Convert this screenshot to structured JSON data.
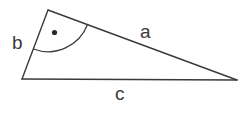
{
  "diagram": {
    "type": "right-triangle",
    "stroke_color": "#3a3a3a",
    "background": "#ffffff",
    "vertices": {
      "top": {
        "x": 48,
        "y": 10
      },
      "bottom_left": {
        "x": 22,
        "y": 79
      },
      "right": {
        "x": 237,
        "y": 80
      }
    },
    "sides": [
      {
        "id": "a",
        "label": "a",
        "from": "top",
        "to": "right"
      },
      {
        "id": "b",
        "label": "b",
        "from": "top",
        "to": "bottom_left"
      },
      {
        "id": "c",
        "label": "c",
        "from": "bottom_left",
        "to": "right"
      }
    ],
    "right_angle_marker": {
      "vertex": "top",
      "style": "arc-with-dot"
    },
    "labels": {
      "a": "a",
      "b": "b",
      "c": "c"
    }
  }
}
